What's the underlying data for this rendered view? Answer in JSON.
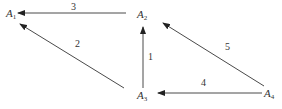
{
  "diagram": {
    "type": "directed-graph",
    "colors": {
      "stroke": "#4a4a4a",
      "text": "#333333",
      "background": "#ffffff"
    },
    "nodes": [
      {
        "id": "A1",
        "letter": "A",
        "sub": "1",
        "x": 6,
        "y": 8
      },
      {
        "id": "A2",
        "letter": "A",
        "sub": "2",
        "x": 137,
        "y": 9
      },
      {
        "id": "A3",
        "letter": "A",
        "sub": "3",
        "x": 137,
        "y": 90
      },
      {
        "id": "A4",
        "letter": "A",
        "sub": "4",
        "x": 264,
        "y": 88
      }
    ],
    "edges": [
      {
        "label": "1",
        "from": "A3",
        "to": "A2",
        "x1": 143,
        "y1": 88,
        "x2": 143,
        "y2": 27,
        "lx": 148,
        "ly": 52
      },
      {
        "label": "2",
        "from": "A3",
        "to": "A1",
        "x1": 124,
        "y1": 88,
        "x2": 20,
        "y2": 24,
        "lx": 75,
        "ly": 39
      },
      {
        "label": "3",
        "from": "A2",
        "to": "A1",
        "x1": 126,
        "y1": 13,
        "x2": 18,
        "y2": 13,
        "lx": 71,
        "ly": 2
      },
      {
        "label": "4",
        "from": "A4",
        "to": "A3",
        "x1": 262,
        "y1": 93,
        "x2": 158,
        "y2": 93,
        "lx": 201,
        "ly": 78
      },
      {
        "label": "5",
        "from": "A4",
        "to": "A2",
        "x1": 264,
        "y1": 86,
        "x2": 163,
        "y2": 23,
        "lx": 225,
        "ly": 42
      }
    ]
  }
}
